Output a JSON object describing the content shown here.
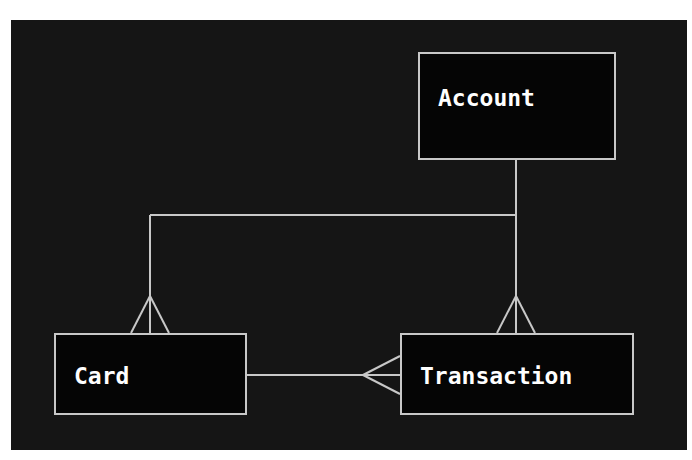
{
  "diagram": {
    "type": "entity-relationship",
    "colors": {
      "page_background": "#ffffff",
      "canvas_background": "#151515",
      "entity_fill": "#050505",
      "stroke": "#c8c8c8",
      "text": "#ffffff"
    },
    "entities": [
      {
        "id": "account",
        "label": "Account"
      },
      {
        "id": "card",
        "label": "Card"
      },
      {
        "id": "transaction",
        "label": "Transaction"
      }
    ],
    "relationships": [
      {
        "from": "account",
        "to": "card",
        "from_cardinality": "one",
        "to_cardinality": "many"
      },
      {
        "from": "account",
        "to": "transaction",
        "from_cardinality": "one",
        "to_cardinality": "many"
      },
      {
        "from": "card",
        "to": "transaction",
        "from_cardinality": "one",
        "to_cardinality": "many"
      }
    ]
  }
}
